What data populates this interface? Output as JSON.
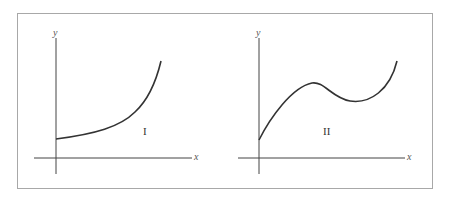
{
  "figure": {
    "panels": [
      {
        "id": "I",
        "label": "I",
        "x_axis_label": "x",
        "y_axis_label": "y",
        "description": "Increasing, concave-up curve starting above the origin"
      },
      {
        "id": "II",
        "label": "II",
        "x_axis_label": "x",
        "y_axis_label": "y",
        "description": "Curve rising to a local maximum, dipping to a local minimum, then rising again"
      }
    ],
    "colors": {
      "frame": "#a8a8a8",
      "axis": "#444444",
      "curve": "#333333"
    }
  }
}
